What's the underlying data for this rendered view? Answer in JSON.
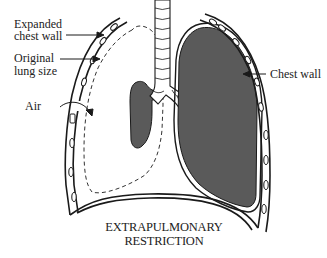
{
  "diagram": {
    "title": "EXTRAPULMONARY RESTRICTION",
    "caption_lines": [
      "EXTRAPULMONARY",
      "RESTRICTION"
    ],
    "labels": {
      "expanded_chest_wall": [
        "Expanded",
        "chest wall"
      ],
      "original_lung_size": [
        "Original",
        "lung size"
      ],
      "air": "Air",
      "chest_wall": "Chest wall"
    },
    "colors": {
      "lung_fill": "#5a5a5a",
      "line": "#1a1a1a",
      "background": "#ffffff"
    }
  }
}
